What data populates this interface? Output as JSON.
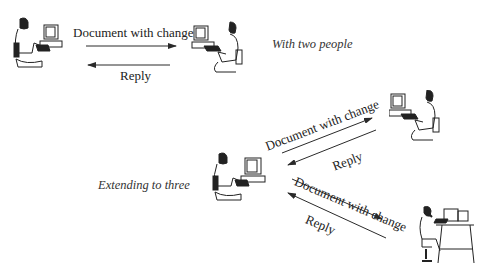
{
  "diagram": {
    "top": {
      "caption": "With two people",
      "send_label": "Document with change",
      "reply_label": "Reply",
      "people": [
        "woman-at-computer",
        "man-at-computer"
      ]
    },
    "bottom": {
      "caption": "Extending to three",
      "upper_link": {
        "send_label": "Document with change",
        "reply_label": "Reply"
      },
      "lower_link": {
        "send_label": "Document with change",
        "reply_label": "Reply"
      },
      "people": [
        "woman-at-computer",
        "man-at-computer",
        "man-at-desk-on-phone"
      ]
    },
    "colors": {
      "line": "#2a2a2a",
      "text": "#222222",
      "background": "#ffffff"
    }
  }
}
